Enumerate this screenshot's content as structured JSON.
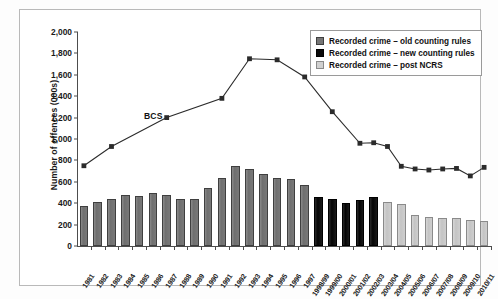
{
  "chart_data": {
    "type": "bar",
    "title": "",
    "subtitle": "",
    "xlabel": "",
    "ylabel": "Number of offences (000s)",
    "ylim": [
      0,
      2000
    ],
    "yticks": [
      "0",
      "200",
      "400",
      "600",
      "800",
      "1,000",
      "1,200",
      "1,400",
      "1,600",
      "1,800",
      "2,000"
    ],
    "ytick_values": [
      0,
      200,
      400,
      600,
      800,
      1000,
      1200,
      1400,
      1600,
      1800,
      2000
    ],
    "grid": false,
    "legend_position": "top-right",
    "categories": [
      "1981",
      "1982",
      "1983",
      "1984",
      "1985",
      "1986",
      "1987",
      "1988",
      "1989",
      "1990",
      "1991",
      "1992",
      "1993",
      "1994",
      "1995",
      "1996",
      "1997",
      "1998/99",
      "1999/00",
      "2000/01",
      "2001/02",
      "2002/03",
      "2003/04",
      "2004/05",
      "2005/06",
      "2006/07",
      "2007/08",
      "2008/09",
      "2009/10",
      "2010/11"
    ],
    "series": [
      {
        "name": "Recorded crime – old counting rules",
        "type": "bar",
        "color": "#767676",
        "values": [
          370,
          415,
          435,
          480,
          465,
          495,
          480,
          440,
          440,
          545,
          640,
          745,
          720,
          675,
          640,
          625,
          570,
          null,
          null,
          null,
          null,
          null,
          null,
          null,
          null,
          null,
          null,
          null,
          null,
          null
        ]
      },
      {
        "name": "Recorded crime – new counting rules",
        "type": "bar",
        "color": "#0a0a0a",
        "values": [
          null,
          null,
          null,
          null,
          null,
          null,
          null,
          null,
          null,
          null,
          null,
          null,
          null,
          null,
          null,
          null,
          null,
          460,
          435,
          400,
          430,
          455,
          null,
          null,
          null,
          null,
          null,
          null,
          null,
          null
        ]
      },
      {
        "name": "Recorded crime – post NCRS",
        "type": "bar",
        "color": "#d0d0d0",
        "values": [
          null,
          null,
          null,
          null,
          null,
          null,
          null,
          null,
          null,
          null,
          null,
          null,
          null,
          null,
          null,
          null,
          null,
          null,
          null,
          null,
          null,
          null,
          410,
          390,
          290,
          275,
          265,
          260,
          245,
          235
        ]
      },
      {
        "name": "BCS",
        "type": "line",
        "color": "#2b2b2b",
        "marker": "square",
        "points": [
          {
            "category": "1981",
            "value": 750
          },
          {
            "category": "1983",
            "value": 930
          },
          {
            "category": "1987",
            "value": 1200
          },
          {
            "category": "1991",
            "value": 1380
          },
          {
            "category": "1993",
            "value": 1750
          },
          {
            "category": "1995",
            "value": 1740
          },
          {
            "category": "1997",
            "value": 1580
          },
          {
            "category": "1999/00",
            "value": 1255
          },
          {
            "category": "2001/02",
            "value": 960
          },
          {
            "category": "2002/03",
            "value": 965
          },
          {
            "category": "2003/04",
            "value": 930
          },
          {
            "category": "2004/05",
            "value": 745
          },
          {
            "category": "2005/06",
            "value": 720
          },
          {
            "category": "2006/07",
            "value": 710
          },
          {
            "category": "2007/08",
            "value": 720
          },
          {
            "category": "2008/09",
            "value": 725
          },
          {
            "category": "2009/10",
            "value": 655
          },
          {
            "category": "2010/11",
            "value": 735
          }
        ]
      }
    ],
    "annotations": [
      {
        "text": "BCS",
        "category": "1986",
        "value": 1210
      }
    ]
  },
  "legend": {
    "items": [
      {
        "label": "Recorded crime – old counting rules",
        "swatch": "old"
      },
      {
        "label": "Recorded crime – new counting rules",
        "swatch": "new"
      },
      {
        "label": "Recorded crime – post NCRS",
        "swatch": "ncrs"
      }
    ]
  }
}
